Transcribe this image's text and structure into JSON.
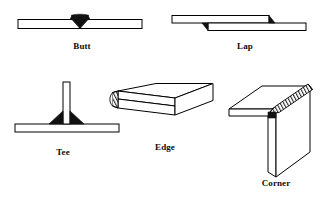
{
  "figure": {
    "background_color": "#ffffff",
    "line_color": "#000000",
    "weld_fill_color": "#111111",
    "width": 327,
    "height": 205
  },
  "joints": [
    {
      "id": "butt",
      "label": "Butt",
      "view": "section",
      "description": "Two plates aligned end to end in the same plane with a weld bead at the center seam",
      "weld_style": "solid-bead"
    },
    {
      "id": "lap",
      "label": "Lap",
      "view": "section",
      "description": "Two plates overlapping one another with weld beads at each overlap end",
      "weld_style": "solid-bead"
    },
    {
      "id": "tee",
      "label": "Tee",
      "view": "section",
      "description": "Vertical plate standing perpendicular on a horizontal plate with fillet welds on both sides",
      "weld_style": "solid-fillet"
    },
    {
      "id": "edge",
      "label": "Edge",
      "view": "isometric",
      "description": "Two parallel plates stacked face to face welded along their common edge",
      "weld_style": "hatched-bead"
    },
    {
      "id": "corner",
      "label": "Corner",
      "view": "isometric",
      "description": "Two plates meeting at a right angle welded along the outside corner",
      "weld_style": "hatched-bead"
    }
  ]
}
